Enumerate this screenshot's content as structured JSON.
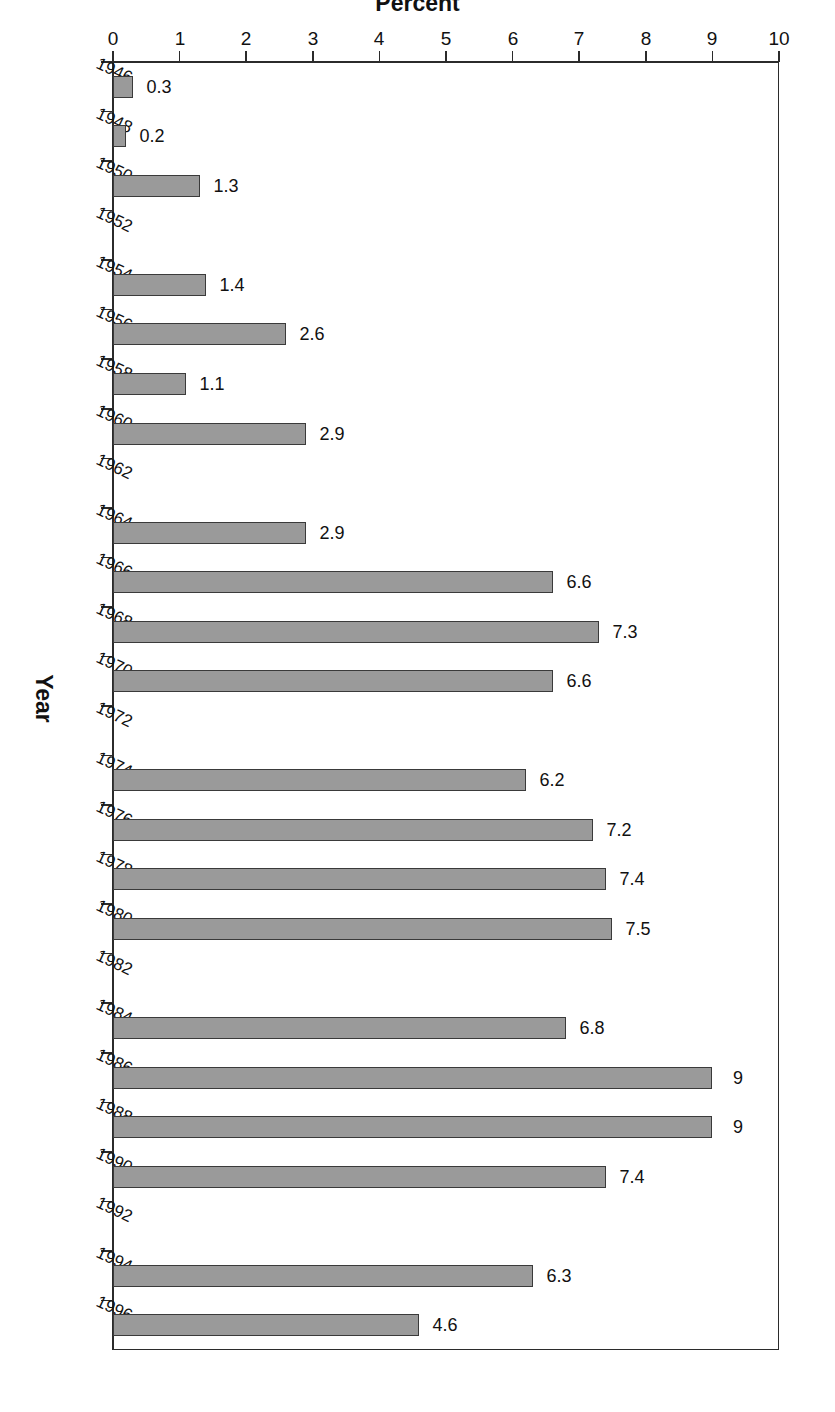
{
  "chart_data": {
    "type": "bar",
    "orientation": "horizontal",
    "title": "",
    "subtitle": "",
    "xlabel": "Percent",
    "ylabel": "Year",
    "xlim": [
      0,
      10
    ],
    "xticks": [
      10,
      9,
      8,
      7,
      6,
      5,
      4,
      3,
      2,
      1,
      0
    ],
    "xtick_labels": [
      "10",
      "9",
      "8",
      "7",
      "6",
      "5",
      "4",
      "3",
      "2",
      "1",
      "0"
    ],
    "ylim": [
      1946,
      1998
    ],
    "yticks": [
      1946,
      1948,
      1950,
      1952,
      1954,
      1956,
      1958,
      1960,
      1962,
      1964,
      1966,
      1968,
      1970,
      1972,
      1974,
      1976,
      1978,
      1980,
      1982,
      1984,
      1986,
      1988,
      1990,
      1992,
      1994,
      1996
    ],
    "ytick_labels": [
      "1946",
      "1948",
      "1950",
      "1952",
      "1954",
      "1956",
      "1958",
      "1960",
      "1962",
      "1964",
      "1966",
      "1968",
      "1970",
      "1972",
      "1974",
      "1976",
      "1978",
      "1980",
      "1982",
      "1984",
      "1986",
      "1988",
      "1990",
      "1992",
      "1994",
      "1996"
    ],
    "grid": false,
    "legend": false,
    "bar_fill_color": "#9a9a9a",
    "bar_edge_color": "#3a3a3a",
    "categories": [
      1947,
      1949,
      1951,
      1955,
      1957,
      1959,
      1961,
      1965,
      1967,
      1969,
      1971,
      1975,
      1977,
      1979,
      1981,
      1985,
      1987,
      1989,
      1991,
      1995,
      1997
    ],
    "values": [
      0.3,
      0.2,
      1.3,
      1.4,
      2.6,
      1.1,
      2.9,
      2.9,
      6.6,
      7.3,
      6.6,
      6.2,
      7.2,
      7.4,
      7.5,
      6.8,
      9,
      9,
      7.4,
      6.3,
      4.6
    ],
    "value_labels": [
      "0.3",
      "0.2",
      "1.3",
      "1.4",
      "2.6",
      "1.1",
      "2.9",
      "2.9",
      "6.6",
      "7.3",
      "6.6",
      "6.2",
      "7.2",
      "7.4",
      "7.5",
      "6.8",
      "9",
      "9",
      "7.4",
      "6.3",
      "4.6"
    ],
    "bars": [
      {
        "category": 1947,
        "value": 0.3,
        "label": "0.3"
      },
      {
        "category": 1949,
        "value": 0.2,
        "label": "0.2"
      },
      {
        "category": 1951,
        "value": 1.3,
        "label": "1.3"
      },
      {
        "category": 1955,
        "value": 1.4,
        "label": "1.4"
      },
      {
        "category": 1957,
        "value": 2.6,
        "label": "2.6"
      },
      {
        "category": 1959,
        "value": 1.1,
        "label": "1.1"
      },
      {
        "category": 1961,
        "value": 2.9,
        "label": "2.9"
      },
      {
        "category": 1965,
        "value": 2.9,
        "label": "2.9"
      },
      {
        "category": 1967,
        "value": 6.6,
        "label": "6.6"
      },
      {
        "category": 1969,
        "value": 7.3,
        "label": "7.3"
      },
      {
        "category": 1971,
        "value": 6.6,
        "label": "6.6"
      },
      {
        "category": 1975,
        "value": 6.2,
        "label": "6.2"
      },
      {
        "category": 1977,
        "value": 7.2,
        "label": "7.2"
      },
      {
        "category": 1979,
        "value": 7.4,
        "label": "7.4"
      },
      {
        "category": 1981,
        "value": 7.5,
        "label": "7.5"
      },
      {
        "category": 1985,
        "value": 6.8,
        "label": "6.8"
      },
      {
        "category": 1987,
        "value": 9,
        "label": "9"
      },
      {
        "category": 1989,
        "value": 9,
        "label": "9"
      },
      {
        "category": 1991,
        "value": 7.4,
        "label": "7.4"
      },
      {
        "category": 1995,
        "value": 6.3,
        "label": "6.3"
      },
      {
        "category": 1997,
        "value": 4.6,
        "label": "4.6"
      }
    ]
  },
  "axis": {
    "percent_title": "Percent",
    "year_title": "Year"
  }
}
